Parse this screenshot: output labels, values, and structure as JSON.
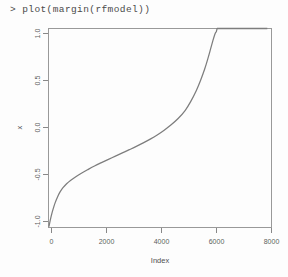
{
  "console": {
    "prompt": ">",
    "command": "plot(margin(rfmodel))",
    "full_line": "> plot(margin(rfmodel))"
  },
  "chart_data": {
    "type": "line",
    "title": "",
    "subtitle": "",
    "xlabel": "Index",
    "ylabel": "x",
    "xlim": [
      0,
      8000
    ],
    "ylim": [
      -1.0,
      1.0
    ],
    "grid": false,
    "legend": null,
    "x_ticks": [
      0,
      2000,
      4000,
      6000,
      8000
    ],
    "x_tick_labels": [
      "0",
      "2000",
      "4000",
      "6000",
      "8000"
    ],
    "y_ticks": [
      -1.0,
      -0.5,
      0.0,
      0.5,
      1.0
    ],
    "y_tick_labels": [
      "-1.0",
      "-0.5",
      "0.0",
      "0.5",
      "1.0"
    ],
    "y_tick_rotation_deg": 90,
    "series": [
      {
        "name": "margin",
        "color": "#7d7d7d",
        "x": [
          20,
          60,
          110,
          170,
          240,
          320,
          410,
          520,
          650,
          800,
          980,
          1180,
          1400,
          1650,
          1900,
          2150,
          2400,
          2650,
          2900,
          3150,
          3400,
          3650,
          3900,
          4150,
          4400,
          4650,
          4900,
          5100,
          5300,
          5450,
          5600,
          5720,
          5820,
          5900,
          5960,
          6000,
          6020,
          6050,
          6500,
          7000,
          7500,
          7850
        ],
        "y": [
          -0.985,
          -0.93,
          -0.87,
          -0.81,
          -0.75,
          -0.695,
          -0.645,
          -0.6,
          -0.56,
          -0.525,
          -0.49,
          -0.455,
          -0.42,
          -0.382,
          -0.348,
          -0.315,
          -0.283,
          -0.25,
          -0.218,
          -0.185,
          -0.15,
          -0.112,
          -0.07,
          -0.022,
          0.032,
          0.095,
          0.175,
          0.265,
          0.375,
          0.475,
          0.59,
          0.7,
          0.8,
          0.88,
          0.935,
          0.962,
          0.968,
          1.0,
          1.0,
          1.0,
          1.0,
          1.0
        ]
      }
    ],
    "plateau": {
      "y_value": 1.0,
      "x_start": 6050,
      "x_end": 7850
    }
  },
  "colors": {
    "background": "#fdfdfd",
    "curve": "#7d7d7d",
    "axis": "#7b7b7b",
    "box": "#8e8e8e",
    "text": "#5d5d5d",
    "console_text": "#4a4a4a"
  }
}
